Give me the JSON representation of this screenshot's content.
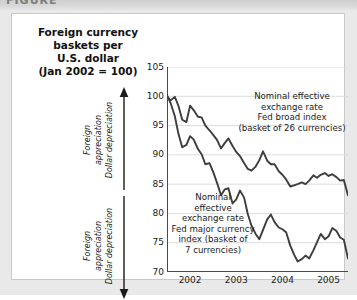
{
  "caption_bar": {
    "text": "FIGURE"
  },
  "title": {
    "line1": "Foreign currency",
    "line2": "baskets per",
    "line3": "U.S. dollar",
    "line4": "(Jan 2002 = 100)"
  },
  "axis_notes": {
    "up": {
      "line1": "Foreign",
      "line2": "appreciation",
      "line3": "Dollar depreciation",
      "arrow": "arrow-up-icon"
    },
    "down": {
      "line1": "Foreign",
      "line2": "appreciation",
      "line3": "Dollar depreciation",
      "arrow": "arrow-down-icon"
    }
  },
  "series_notes": {
    "broad": {
      "line1": "Nominal effective",
      "line2": "exchange rate",
      "line3": "Fed broad index",
      "line4": "(basket of 26 currencies)"
    },
    "major": {
      "line1": "Nominal",
      "line2": "effective",
      "line3": "exchange rate",
      "line4": "Fed major currency",
      "line5": "index (basket of",
      "line6": "7 currencies)"
    }
  },
  "colors": {
    "line": "#3d3d3d",
    "grid": "#dcdcdc",
    "axis": "#4a4a4a",
    "text": "#1a1a1a",
    "card_bg": "#ffffff",
    "page_bg": "#e9e9e9"
  },
  "chart_data": {
    "type": "line",
    "title": "Foreign currency baskets per U.S. dollar (Jan 2002 = 100)",
    "xlabel": "",
    "ylabel": "Index (Jan 2002 = 100)",
    "xlim": [
      2002.0,
      2005.92
    ],
    "ylim": [
      70,
      105
    ],
    "yticks": [
      70,
      75,
      80,
      85,
      90,
      95,
      100,
      105
    ],
    "xticks": [
      2002,
      2003,
      2004,
      2005
    ],
    "xtick_labels": [
      "2002",
      "2003",
      "2004",
      "2005"
    ],
    "grid": "horizontal",
    "legend": "annotations-in-plot",
    "series": [
      {
        "name": "Nominal effective exchange rate, Fed broad index (basket of 26 currencies)",
        "x": [
          2002.0,
          2002.08,
          2002.17,
          2002.25,
          2002.33,
          2002.42,
          2002.5,
          2002.58,
          2002.67,
          2002.75,
          2002.83,
          2002.92,
          2003.0,
          2003.08,
          2003.17,
          2003.25,
          2003.33,
          2003.42,
          2003.5,
          2003.58,
          2003.67,
          2003.75,
          2003.83,
          2003.92,
          2004.0,
          2004.08,
          2004.17,
          2004.25,
          2004.33,
          2004.42,
          2004.5,
          2004.58,
          2004.67,
          2004.75,
          2004.83,
          2004.92,
          2005.0,
          2005.08,
          2005.17,
          2005.25,
          2005.33,
          2005.42,
          2005.5,
          2005.58,
          2005.67,
          2005.75,
          2005.83,
          2005.92
        ],
        "values": [
          100.0,
          99.3,
          99.9,
          98.3,
          96.0,
          95.6,
          98.4,
          97.6,
          96.5,
          96.4,
          95.0,
          94.2,
          93.4,
          92.6,
          91.1,
          92.0,
          92.8,
          91.5,
          90.5,
          89.8,
          88.6,
          87.6,
          87.3,
          88.0,
          89.1,
          90.6,
          89.0,
          88.4,
          88.4,
          87.2,
          86.6,
          85.8,
          84.6,
          84.8,
          85.0,
          85.3,
          85.0,
          85.6,
          86.5,
          86.1,
          86.6,
          86.9,
          86.4,
          86.7,
          86.2,
          85.6,
          85.7,
          83.1
        ]
      },
      {
        "name": "Nominal effective exchange rate, Fed major currency index (basket of 7 currencies)",
        "x": [
          2002.0,
          2002.08,
          2002.17,
          2002.25,
          2002.33,
          2002.42,
          2002.5,
          2002.58,
          2002.67,
          2002.75,
          2002.83,
          2002.92,
          2003.0,
          2003.08,
          2003.17,
          2003.25,
          2003.33,
          2003.42,
          2003.5,
          2003.58,
          2003.67,
          2003.75,
          2003.83,
          2003.92,
          2004.0,
          2004.08,
          2004.17,
          2004.25,
          2004.33,
          2004.42,
          2004.5,
          2004.58,
          2004.67,
          2004.75,
          2004.83,
          2004.92,
          2005.0,
          2005.08,
          2005.17,
          2005.25,
          2005.33,
          2005.42,
          2005.5,
          2005.58,
          2005.67,
          2005.75,
          2005.83,
          2005.92
        ],
        "values": [
          100.2,
          98.8,
          96.6,
          93.5,
          91.3,
          91.7,
          93.2,
          92.6,
          91.0,
          90.1,
          88.4,
          88.6,
          87.1,
          85.3,
          83.1,
          84.1,
          84.3,
          81.7,
          82.4,
          83.9,
          82.7,
          79.9,
          77.9,
          76.5,
          75.6,
          77.2,
          79.0,
          79.8,
          78.5,
          77.6,
          77.3,
          76.8,
          74.5,
          73.0,
          71.8,
          72.2,
          72.8,
          72.3,
          73.7,
          75.1,
          76.5,
          75.6,
          76.1,
          77.5,
          77.0,
          75.9,
          75.5,
          72.3
        ]
      }
    ]
  }
}
